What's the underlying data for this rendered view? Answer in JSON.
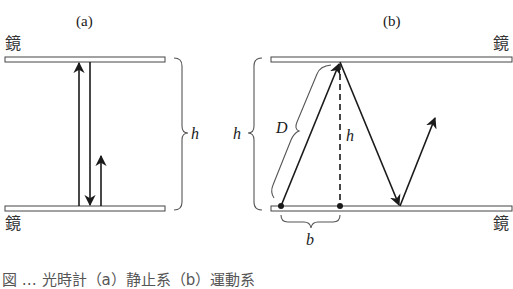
{
  "panels": {
    "a": {
      "label": "(a)",
      "mirror_top_label": "鏡",
      "mirror_bottom_label": "鏡",
      "height_label": "h"
    },
    "b": {
      "label": "(b)",
      "mirror_top_label": "鏡",
      "mirror_bottom_label": "鏡",
      "height_label_left": "h",
      "height_label_center": "h",
      "diagonal_label": "D",
      "base_label": "b"
    }
  },
  "caption": "図 … 光時計（a）静止系（b）運動系",
  "colors": {
    "line": "#1a1a1a",
    "mirror_fill": "#ffffff",
    "mirror_stroke": "#444444",
    "brace": "#555555"
  }
}
